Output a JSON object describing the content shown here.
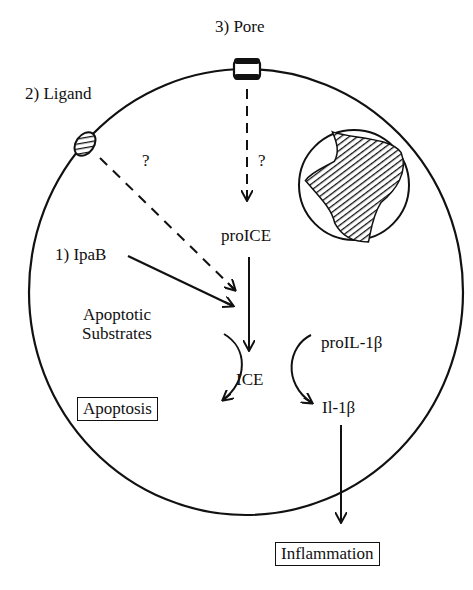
{
  "diagram": {
    "labels": {
      "pore": "3) Pore",
      "ligand": "2) Ligand",
      "ipab": "1) IpaB",
      "q_ligand": "?",
      "q_pore": "?",
      "proice": "proICE",
      "apoptotic_substrates_1": "Apoptotic",
      "apoptotic_substrates_2": "Substrates",
      "ice": "ICE",
      "proil1b": "proIL-1β",
      "il1b": "Il-1β",
      "apoptosis": "Apoptosis",
      "inflammation": "Inflammation"
    },
    "nodes": [
      {
        "id": "pore",
        "type": "membrane-channel"
      },
      {
        "id": "ligand",
        "type": "membrane-receptor"
      },
      {
        "id": "nucleus",
        "type": "hatched-organelle"
      },
      {
        "id": "proICE"
      },
      {
        "id": "ICE"
      },
      {
        "id": "proIL-1β"
      },
      {
        "id": "Il-1β"
      },
      {
        "id": "Apoptotic Substrates"
      },
      {
        "id": "Apoptosis",
        "boxed": true
      },
      {
        "id": "Inflammation",
        "boxed": true
      }
    ],
    "edges": [
      {
        "from": "Pore",
        "to": "proICE",
        "style": "dashed",
        "label": "?"
      },
      {
        "from": "Ligand",
        "to": "ICE",
        "style": "dashed",
        "label": "?"
      },
      {
        "from": "IpaB",
        "to": "ICE",
        "style": "solid"
      },
      {
        "from": "proICE",
        "to": "ICE",
        "style": "solid"
      },
      {
        "from": "Apoptotic Substrates",
        "to": "Apoptosis",
        "style": "curved"
      },
      {
        "from": "proIL-1β",
        "to": "Il-1β",
        "style": "curved"
      },
      {
        "from": "Il-1β",
        "to": "Inflammation",
        "style": "solid"
      }
    ]
  }
}
